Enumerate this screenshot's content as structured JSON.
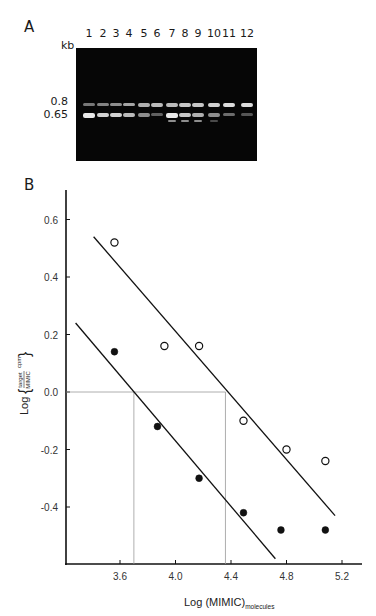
{
  "panel_a": {
    "label": "A",
    "unit_label": "kb",
    "lanes": [
      "1",
      "2",
      "3",
      "4",
      "5",
      "6",
      "7",
      "8",
      "9",
      "10",
      "11",
      "12"
    ],
    "markers": [
      {
        "label": "0.8",
        "band": "upper"
      },
      {
        "label": "0.65",
        "band": "lower"
      }
    ],
    "gel_bands": {
      "upper_intensity": [
        0.5,
        0.55,
        0.6,
        0.7,
        0.75,
        0.8,
        0.8,
        0.85,
        0.85,
        0.9,
        0.95,
        0.95
      ],
      "lower_intensity": [
        1.0,
        0.9,
        0.9,
        0.8,
        0.6,
        0.4,
        1.0,
        0.85,
        0.75,
        0.6,
        0.45,
        0.35
      ],
      "extra_bands_lanes": [
        "7",
        "8",
        "9",
        "10"
      ]
    }
  },
  "panel_b": {
    "label": "B",
    "ylabel_prefix": "Log",
    "ylabel_numerator": "target",
    "ylabel_denominator": "MIMIC",
    "ylabel_suffix": "cpm",
    "xlabel_main": "Log (MIMIC)",
    "xlabel_sub": "molecules"
  },
  "chart_data": {
    "type": "scatter",
    "title": "",
    "xlabel": "Log (MIMIC)_molecules",
    "ylabel": "Log (target/MIMIC cpm)",
    "xlim": [
      3.3,
      5.35
    ],
    "ylim": [
      -0.6,
      0.7
    ],
    "x_ticks": [
      3.6,
      4.0,
      4.4,
      4.8,
      5.2
    ],
    "x_tick_labels": [
      "3.6",
      "4.0",
      "4.4",
      "4.8",
      "5.2"
    ],
    "y_ticks": [
      0.6,
      0.4,
      0.2,
      0.0,
      -0.2,
      -0.4
    ],
    "y_tick_labels": [
      "0.6",
      "0.4",
      "0.2",
      "0.0",
      "-0.2",
      "-0.4"
    ],
    "grid": false,
    "legend": null,
    "series": [
      {
        "name": "open circles",
        "marker": "open-circle",
        "x": [
          3.56,
          3.92,
          4.17,
          4.49,
          4.8,
          5.08
        ],
        "y": [
          0.52,
          0.16,
          0.16,
          -0.1,
          -0.2,
          -0.24
        ],
        "fit_line": {
          "x": [
            3.41,
            5.15
          ],
          "y": [
            0.54,
            -0.43
          ]
        }
      },
      {
        "name": "filled circles",
        "marker": "filled-circle",
        "x": [
          3.56,
          3.87,
          4.17,
          4.49,
          4.76,
          5.08
        ],
        "y": [
          0.14,
          -0.12,
          -0.3,
          -0.42,
          -0.48,
          -0.48
        ],
        "fit_line": {
          "x": [
            3.28,
            4.72
          ],
          "y": [
            0.24,
            -0.58
          ]
        }
      }
    ],
    "annotations": [
      {
        "type": "equivalence-line",
        "y": 0.0,
        "x_intersections": [
          3.7,
          4.36
        ]
      }
    ]
  }
}
